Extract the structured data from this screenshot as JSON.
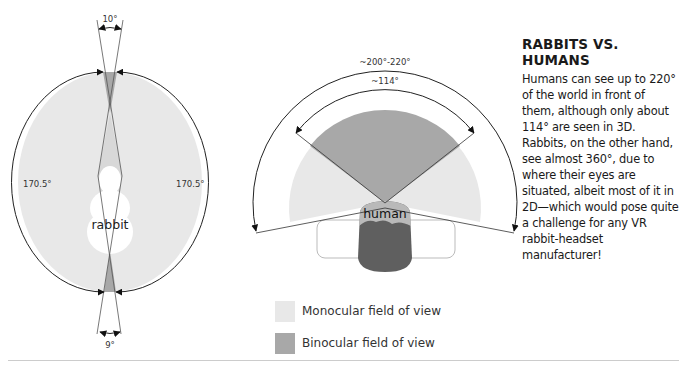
{
  "rabbit_diagram": {
    "label": "rabbit",
    "top_angle": "10°",
    "bottom_angle": "9°",
    "left_angle": "170.5°",
    "right_angle": "170.5°"
  },
  "human_diagram": {
    "label": "human",
    "outer_angle": "~200°-220°",
    "inner_angle": "~114°"
  },
  "sidebar": {
    "title": "RABBITS VS. HUMANS",
    "body": "Humans can see up to 220° of the world in front of them, although only about 114° are seen in 3D.  Rabbits, on the other hand, see almost 360°, due to where their eyes are situated, albeit most of it in 2D—which would pose quite a challenge for any VR rabbit-headset manufacturer!"
  },
  "legend": {
    "items": [
      {
        "label": "Monocular field of view",
        "color": "#e8e8e8"
      },
      {
        "label": "Binocular field of view",
        "color": "#a8a8a8"
      }
    ]
  },
  "colors": {
    "monocular": "#e8e8e8",
    "binocular": "#a8a8a8",
    "head_dark": "#5f5f5f",
    "line": "#333333"
  }
}
